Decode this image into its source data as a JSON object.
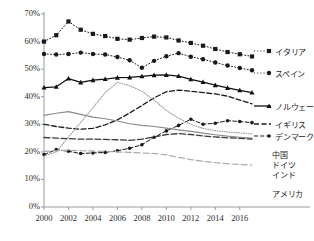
{
  "chart_data": {
    "type": "line",
    "title": "",
    "xlabel": "",
    "ylabel": "",
    "x": [
      2000,
      2001,
      2002,
      2003,
      2004,
      2005,
      2006,
      2007,
      2008,
      2009,
      2010,
      2011,
      2012,
      2013,
      2014,
      2015,
      2016,
      2017
    ],
    "xlim": [
      2000,
      2017
    ],
    "ylim": [
      0,
      70
    ],
    "xticks": [
      "2000",
      "2002",
      "2004",
      "2006",
      "2008",
      "2010",
      "2012",
      "2014",
      "2016"
    ],
    "xtick_values": [
      2000,
      2002,
      2004,
      2006,
      2008,
      2010,
      2012,
      2014,
      2016
    ],
    "yticks": [
      "0%",
      "10%",
      "20%",
      "30%",
      "40%",
      "50%",
      "60%",
      "70%"
    ],
    "ytick_values": [
      0,
      10,
      20,
      30,
      40,
      50,
      60,
      70
    ],
    "grid": false,
    "legend_position": "right",
    "series": [
      {
        "name": "イタリア",
        "label": "イタリア",
        "color": "#1a1a1a",
        "marker": "square",
        "dash": "1,2.2",
        "width": 1.0,
        "values": [
          60.0,
          62.3,
          67.3,
          64.3,
          62.8,
          62.0,
          61.0,
          60.7,
          61.3,
          61.8,
          61.5,
          60.4,
          59.5,
          58.5,
          57.3,
          56.2,
          55.4,
          54.6
        ]
      },
      {
        "name": "スペイン",
        "label": "スペイン",
        "color": "#1a1a1a",
        "marker": "circle",
        "dash": "1,2.2",
        "width": 1.0,
        "values": [
          55.5,
          55.3,
          55.5,
          56.0,
          55.5,
          55.3,
          54.4,
          53.2,
          50.5,
          53.0,
          54.7,
          55.8,
          54.5,
          53.6,
          52.4,
          51.3,
          50.4,
          49.6
        ]
      },
      {
        "name": "ノルウェー",
        "label": "ノルウェー",
        "color": "#101010",
        "marker": "triangle",
        "dash": "none",
        "width": 1.3,
        "values": [
          43.3,
          43.6,
          46.6,
          45.2,
          46.0,
          46.4,
          46.9,
          47.0,
          47.4,
          47.8,
          47.9,
          47.5,
          46.3,
          45.3,
          44.2,
          43.2,
          42.3,
          41.5
        ]
      },
      {
        "name": "イギリス",
        "label": "イギリス",
        "color": "#1a1a1a",
        "marker": "none",
        "dash": "5,2.5",
        "width": 1.3,
        "values": [
          30.0,
          29.2,
          28.6,
          28.2,
          28.5,
          29.8,
          31.6,
          34.1,
          36.8,
          39.6,
          41.8,
          42.4,
          42.0,
          41.5,
          41.0,
          40.2,
          38.8,
          37.4
        ]
      },
      {
        "name": "デンマーク",
        "label": "デンマーク",
        "color": "#1a1a1a",
        "marker": "circle-small",
        "dash": "4,2.2",
        "width": 1.0,
        "values": [
          19.0,
          20.8,
          20.2,
          19.4,
          19.6,
          19.8,
          20.4,
          21.3,
          22.6,
          25.3,
          27.6,
          29.6,
          31.8,
          30.0,
          30.4,
          31.3,
          31.0,
          30.6
        ]
      },
      {
        "name": "中国",
        "label": "中国",
        "color": "#9a9a9a",
        "marker": "none",
        "dash": "0.8,1.6",
        "width": 1.1,
        "values": [
          18.5,
          20.0,
          25.4,
          30.7,
          36.0,
          41.5,
          45.2,
          44.0,
          42.0,
          38.8,
          35.0,
          32.2,
          30.0,
          28.5,
          27.7,
          27.2,
          26.9,
          26.5
        ]
      },
      {
        "name": "ドイツ",
        "label": "ドイツ",
        "color": "#8a8a8a",
        "marker": "none",
        "dash": "none",
        "width": 1.2,
        "values": [
          33.2,
          34.0,
          34.6,
          33.6,
          32.6,
          32.0,
          31.2,
          30.2,
          29.6,
          29.2,
          28.6,
          28.0,
          27.4,
          26.8,
          26.2,
          25.7,
          25.3,
          25.0
        ]
      },
      {
        "name": "インド",
        "label": "インド",
        "color": "#3a3a3a",
        "marker": "none",
        "dash": "6,2.5",
        "width": 1.3,
        "values": [
          25.2,
          25.0,
          24.8,
          24.6,
          24.6,
          24.5,
          24.4,
          24.2,
          24.6,
          25.4,
          26.3,
          26.6,
          26.3,
          25.8,
          25.4,
          25.1,
          24.9,
          24.6
        ]
      },
      {
        "name": "アメリカ",
        "label": "アメリカ",
        "color": "#aaaaaa",
        "marker": "none",
        "dash": "6,3",
        "width": 1.2,
        "values": [
          20.2,
          20.4,
          20.6,
          20.4,
          20.3,
          20.2,
          20.0,
          19.8,
          19.6,
          19.4,
          18.9,
          18.0,
          17.2,
          16.6,
          16.1,
          15.7,
          15.4,
          15.2
        ]
      }
    ]
  },
  "legend": {
    "entries": [
      {
        "label": "イタリア",
        "y": 49
      },
      {
        "label": "スペイン",
        "y": 71
      },
      {
        "label": "ノルウェー",
        "y": 104
      },
      {
        "label": "イギリス",
        "y": 122
      },
      {
        "label": "デンマーク",
        "y": 134
      },
      {
        "label": "中国",
        "y": 152
      },
      {
        "label": "ドイツ",
        "y": 162
      },
      {
        "label": "インド",
        "y": 172
      },
      {
        "label": "アメリカ",
        "y": 191
      }
    ]
  },
  "axis": {
    "line_color": "#9a9a9a",
    "tick_color": "#9a9a9a",
    "text_color": "#2b2b2b"
  }
}
